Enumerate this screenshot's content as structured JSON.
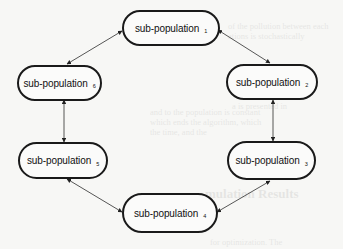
{
  "diagram": {
    "type": "ring-migration-topology",
    "nodes": [
      {
        "id": 1,
        "label": "sub-population",
        "subscript": "1"
      },
      {
        "id": 2,
        "label": "sub-population",
        "subscript": "2"
      },
      {
        "id": 3,
        "label": "sub-population",
        "subscript": "3"
      },
      {
        "id": 4,
        "label": "sub-population",
        "subscript": "4"
      },
      {
        "id": 5,
        "label": "sub-population",
        "subscript": "5"
      },
      {
        "id": 6,
        "label": "sub-population",
        "subscript": "6"
      }
    ],
    "edges": [
      {
        "from": 1,
        "to": 2,
        "bidirectional": true
      },
      {
        "from": 2,
        "to": 3,
        "bidirectional": true
      },
      {
        "from": 3,
        "to": 4,
        "bidirectional": true
      },
      {
        "from": 4,
        "to": 5,
        "bidirectional": true
      },
      {
        "from": 5,
        "to": 6,
        "bidirectional": true
      },
      {
        "from": 6,
        "to": 1,
        "bidirectional": true
      }
    ]
  },
  "background_bleed": {
    "lines": [
      "...",
      "mulation Results"
    ]
  },
  "colors": {
    "node_border": "#1a1a1a",
    "edge": "#444444",
    "background": "#f7f7f5"
  }
}
